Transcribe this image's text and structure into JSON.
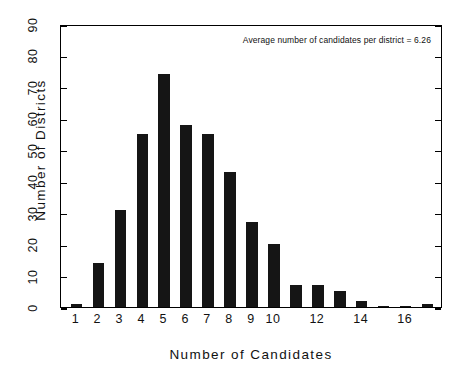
{
  "chart_data": {
    "type": "bar",
    "title": "",
    "xlabel": "Number of Candidates",
    "ylabel": "Number of Districts",
    "categories": [
      1,
      2,
      3,
      4,
      5,
      6,
      7,
      8,
      9,
      10,
      11,
      12,
      13,
      14,
      15,
      16,
      17
    ],
    "values": [
      1,
      14,
      31,
      55,
      74,
      58,
      55,
      43,
      27,
      20,
      7,
      7,
      5,
      2,
      0.3,
      0.3,
      1
    ],
    "xlim": [
      0.3,
      17.7
    ],
    "ylim": [
      0,
      90
    ],
    "ytick_labels": [
      "0",
      "10",
      "20",
      "30",
      "40",
      "50",
      "60",
      "70",
      "80",
      "90"
    ],
    "ytick_values": [
      0,
      10,
      20,
      30,
      40,
      50,
      60,
      70,
      80,
      90
    ],
    "xtick_labels": [
      "1",
      "2",
      "3",
      "4",
      "5",
      "6",
      "7",
      "8",
      "9",
      "10",
      "12",
      "14",
      "16"
    ],
    "xtick_values": [
      1,
      2,
      3,
      4,
      5,
      6,
      7,
      8,
      9,
      10,
      12,
      14,
      16
    ],
    "grid": false,
    "legend": "none",
    "bar_color": "#151515",
    "frame_color": "#000000",
    "background_color": "#ffffff",
    "annotations": [
      {
        "text": "Average number of candidates per district = 6.26",
        "position": "top-right"
      }
    ]
  },
  "annotation_text": "Average number of candidates per district = 6.26"
}
